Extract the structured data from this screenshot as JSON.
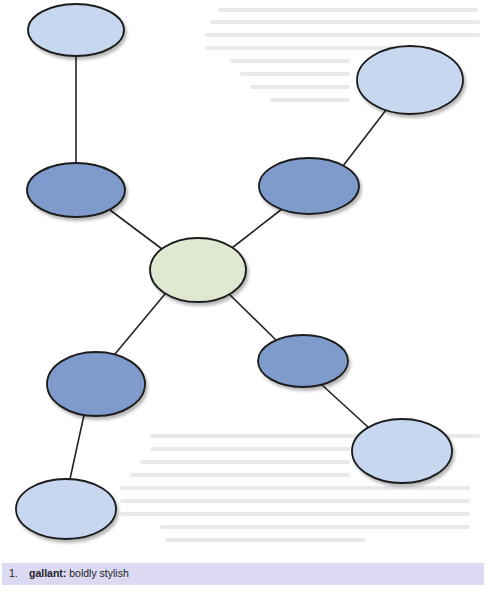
{
  "diagram": {
    "type": "web-organizer",
    "colors": {
      "center_fill": "#dfe8d0",
      "middle_fill": "#7f9bcc",
      "outer_fill": "#c6d7ef",
      "stroke": "#1b1b1b",
      "connector": "#222222"
    },
    "nodes": [
      {
        "id": "center",
        "level": "center",
        "cx": 198,
        "cy": 270,
        "rx": 48,
        "ry": 32
      },
      {
        "id": "mid-upper-left",
        "level": "middle",
        "cx": 76,
        "cy": 190,
        "rx": 49,
        "ry": 27
      },
      {
        "id": "mid-upper-right",
        "level": "middle",
        "cx": 309,
        "cy": 186,
        "rx": 50,
        "ry": 28
      },
      {
        "id": "mid-lower-left",
        "level": "middle",
        "cx": 96,
        "cy": 384,
        "rx": 49,
        "ry": 32
      },
      {
        "id": "mid-lower-right",
        "level": "middle",
        "cx": 303,
        "cy": 361,
        "rx": 45,
        "ry": 26
      },
      {
        "id": "outer-top-left",
        "level": "outer",
        "cx": 76,
        "cy": 30,
        "rx": 48,
        "ry": 26
      },
      {
        "id": "outer-top-right",
        "level": "outer",
        "cx": 410,
        "cy": 80,
        "rx": 53,
        "ry": 34
      },
      {
        "id": "outer-bottom-left",
        "level": "outer",
        "cx": 66,
        "cy": 509,
        "rx": 50,
        "ry": 30
      },
      {
        "id": "outer-bottom-right",
        "level": "outer",
        "cx": 402,
        "cy": 451,
        "rx": 50,
        "ry": 32
      }
    ],
    "edges": [
      {
        "from": "center",
        "to": "mid-upper-left",
        "x1": 162,
        "y1": 249,
        "x2": 110,
        "y2": 210
      },
      {
        "from": "center",
        "to": "mid-upper-right",
        "x1": 232,
        "y1": 248,
        "x2": 282,
        "y2": 209
      },
      {
        "from": "center",
        "to": "mid-lower-left",
        "x1": 165,
        "y1": 294,
        "x2": 115,
        "y2": 354
      },
      {
        "from": "center",
        "to": "mid-lower-right",
        "x1": 229,
        "y1": 294,
        "x2": 276,
        "y2": 340
      },
      {
        "from": "mid-upper-left",
        "to": "outer-top-left",
        "x1": 76,
        "y1": 163,
        "x2": 76,
        "y2": 56
      },
      {
        "from": "mid-upper-right",
        "to": "outer-top-right",
        "x1": 343,
        "y1": 166,
        "x2": 386,
        "y2": 110
      },
      {
        "from": "mid-lower-left",
        "to": "outer-bottom-left",
        "x1": 84,
        "y1": 415,
        "x2": 70,
        "y2": 479
      },
      {
        "from": "mid-lower-right",
        "to": "outer-bottom-right",
        "x1": 322,
        "y1": 385,
        "x2": 368,
        "y2": 427
      }
    ]
  },
  "definition": {
    "number": "1.",
    "term": "gallant:",
    "meaning": "boldly stylish"
  }
}
